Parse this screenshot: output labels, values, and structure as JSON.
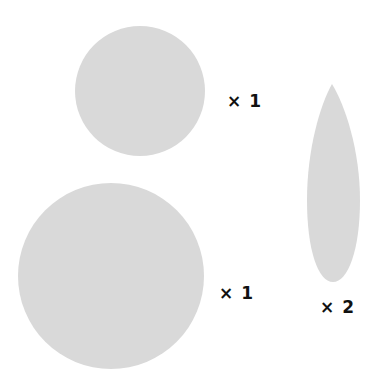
{
  "colors": {
    "shape_fill": "#d9d9d9",
    "label_color": "#111111",
    "background": "#ffffff"
  },
  "shapes": [
    {
      "name": "small-circle",
      "kind": "circle",
      "count_label": "× 1"
    },
    {
      "name": "large-circle",
      "kind": "circle",
      "count_label": "× 1"
    },
    {
      "name": "leaf-ellipse",
      "kind": "pointed-ellipse",
      "count_label": "× 2"
    }
  ]
}
